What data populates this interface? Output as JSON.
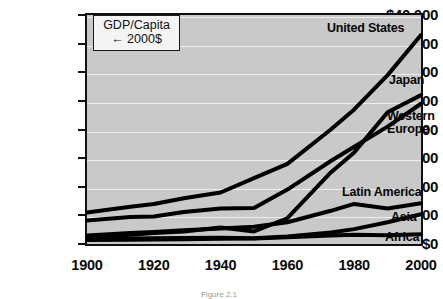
{
  "figure": {
    "caption": "Figure 2.1"
  },
  "legend_box": {
    "line1": "GDP/Capita",
    "line2": "← 2000$"
  },
  "chart_data": {
    "type": "line",
    "title": "",
    "subtitle": "",
    "xlabel": "",
    "ylabel": "GDP/Capita (2000$)",
    "grid": true,
    "legend_position": "inline-right-end-labels",
    "xlim": [
      1900,
      2000
    ],
    "ylim": [
      0,
      40000
    ],
    "x": [
      1900,
      1913,
      1920,
      1929,
      1940,
      1950,
      1960,
      1973,
      1980,
      1990,
      2000
    ],
    "xticks": [
      1900,
      1920,
      1940,
      1960,
      1980,
      2000
    ],
    "xtick_labels": [
      "1900",
      "1920",
      "1940",
      "1960",
      "1980",
      "2000"
    ],
    "yticks": [
      0,
      5000,
      10000,
      15000,
      20000,
      25000,
      30000,
      35000,
      40000
    ],
    "ytick_labels": [
      "$0",
      "$5,000",
      "$10,000",
      "$15,000",
      "$20,000",
      "$25,000",
      "$30,000",
      "$35,000",
      "$40,000"
    ],
    "series": [
      {
        "name": "United States",
        "label": "United States",
        "color": "#000000",
        "x": [
          1900,
          1913,
          1920,
          1929,
          1940,
          1950,
          1960,
          1973,
          1980,
          1990,
          2000
        ],
        "values": [
          5500,
          6500,
          7000,
          8000,
          9000,
          11500,
          14000,
          20000,
          23500,
          29500,
          36500
        ]
      },
      {
        "name": "Japan",
        "label": "Japan",
        "color": "#000000",
        "x": [
          1900,
          1913,
          1920,
          1929,
          1940,
          1950,
          1960,
          1973,
          1980,
          1990,
          2000
        ],
        "values": [
          1300,
          1600,
          1900,
          2200,
          2900,
          2200,
          4500,
          12500,
          16000,
          23000,
          26000
        ]
      },
      {
        "name": "Western Europe",
        "label": "Western Europe",
        "color": "#000000",
        "x": [
          1900,
          1913,
          1920,
          1929,
          1940,
          1950,
          1960,
          1973,
          1980,
          1990,
          2000
        ],
        "values": [
          4100,
          4700,
          4800,
          5600,
          6200,
          6300,
          9500,
          14500,
          17000,
          20500,
          24500
        ]
      },
      {
        "name": "Latin America",
        "label": "Latin America",
        "color": "#000000",
        "x": [
          1900,
          1913,
          1920,
          1929,
          1940,
          1950,
          1960,
          1973,
          1980,
          1990,
          2000
        ],
        "values": [
          1500,
          1900,
          2100,
          2400,
          2700,
          3000,
          3800,
          5800,
          7000,
          6200,
          7100
        ]
      },
      {
        "name": "Asia",
        "label": "Asia",
        "color": "#000000",
        "x": [
          1900,
          1913,
          1920,
          1929,
          1940,
          1950,
          1960,
          1973,
          1980,
          1990,
          2000
        ],
        "values": [
          900,
          950,
          1000,
          1050,
          1100,
          1000,
          1300,
          2000,
          2600,
          3800,
          5200
        ]
      },
      {
        "name": "Africa",
        "label": "Africa",
        "color": "#000000",
        "x": [
          1900,
          1913,
          1920,
          1929,
          1940,
          1950,
          1960,
          1973,
          1980,
          1990,
          2000
        ],
        "values": [
          700,
          750,
          800,
          850,
          900,
          950,
          1200,
          1500,
          1600,
          1550,
          1700
        ]
      }
    ],
    "series_label_positions": [
      {
        "name": "United States",
        "label": "United States",
        "left": 327,
        "top": 22,
        "lines": 1
      },
      {
        "name": "Japan",
        "label": "Japan",
        "left": 389,
        "top": 74,
        "lines": 1
      },
      {
        "name": "Western Europe",
        "label": "Western Europe",
        "left": 387,
        "top": 110,
        "lines": 2
      },
      {
        "name": "Latin America",
        "label": "Latin America",
        "left": 342,
        "top": 186,
        "lines": 1
      },
      {
        "name": "Asia",
        "label": "Asia",
        "left": 391,
        "top": 211,
        "lines": 1
      },
      {
        "name": "Africa",
        "label": "Africa",
        "left": 385,
        "top": 231,
        "lines": 1
      }
    ]
  }
}
